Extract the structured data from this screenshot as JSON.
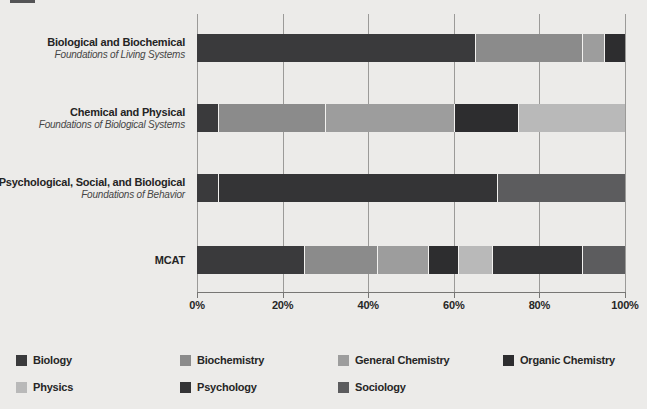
{
  "page": {
    "background": "#ecebe9"
  },
  "chart_data": {
    "type": "bar",
    "orientation": "horizontal",
    "stacked": true,
    "unit": "percent",
    "title": "",
    "xlabel": "",
    "ylabel": "",
    "xlim": [
      0,
      100
    ],
    "x_ticks": [
      "0%",
      "20%",
      "40%",
      "60%",
      "80%",
      "100%"
    ],
    "grid": true,
    "legend_position": "bottom",
    "series_colors": {
      "Biology": "#3a3a3c",
      "Biochemistry": "#8b8b8b",
      "General Chemistry": "#9d9d9d",
      "Organic Chemistry": "#2d2d2f",
      "Physics": "#b9b9b9",
      "Psychology": "#343436",
      "Sociology": "#5c5c5e"
    },
    "rows": [
      {
        "label": "Biological and Biochemical",
        "sublabel": "Foundations of Living Systems",
        "segments": [
          {
            "series": "Biology",
            "value": 65
          },
          {
            "series": "Biochemistry",
            "value": 25
          },
          {
            "series": "General Chemistry",
            "value": 5
          },
          {
            "series": "Organic Chemistry",
            "value": 5
          }
        ]
      },
      {
        "label": "Chemical and Physical",
        "sublabel": "Foundations of Biological Systems",
        "segments": [
          {
            "series": "Biology",
            "value": 5
          },
          {
            "series": "Biochemistry",
            "value": 25
          },
          {
            "series": "General Chemistry",
            "value": 30
          },
          {
            "series": "Organic Chemistry",
            "value": 15
          },
          {
            "series": "Physics",
            "value": 25
          }
        ]
      },
      {
        "label": "Psychological, Social, and Biological",
        "sublabel": "Foundations of Behavior",
        "segments": [
          {
            "series": "Biology",
            "value": 5
          },
          {
            "series": "Psychology",
            "value": 65
          },
          {
            "series": "Sociology",
            "value": 30
          }
        ]
      },
      {
        "label": "MCAT",
        "sublabel": "",
        "segments": [
          {
            "series": "Biology",
            "value": 25
          },
          {
            "series": "Biochemistry",
            "value": 17
          },
          {
            "series": "General Chemistry",
            "value": 12
          },
          {
            "series": "Organic Chemistry",
            "value": 7
          },
          {
            "series": "Physics",
            "value": 8
          },
          {
            "series": "Psychology",
            "value": 21
          },
          {
            "series": "Sociology",
            "value": 10
          }
        ]
      }
    ],
    "legend": [
      "Biology",
      "Biochemistry",
      "General Chemistry",
      "Organic Chemistry",
      "Physics",
      "Psychology",
      "Sociology"
    ]
  }
}
